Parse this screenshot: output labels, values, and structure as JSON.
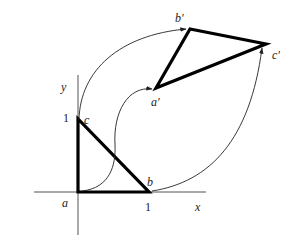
{
  "diagram": {
    "type": "linear-transformation-mapping",
    "axes": {
      "x_label": "x",
      "y_label": "y",
      "x_tick": "1",
      "y_tick": "1"
    },
    "source_triangle": {
      "vertices": [
        {
          "name": "a",
          "label": "a",
          "coords": [
            0,
            0
          ]
        },
        {
          "name": "b",
          "label": "b",
          "coords": [
            1,
            0
          ]
        },
        {
          "name": "c",
          "label": "c",
          "coords": [
            0,
            1
          ]
        }
      ]
    },
    "image_triangle": {
      "vertices": [
        {
          "name": "a'",
          "label": "a'"
        },
        {
          "name": "b'",
          "label": "b'"
        },
        {
          "name": "c'",
          "label": "c'"
        }
      ]
    },
    "mappings": [
      {
        "from": "a",
        "to": "a'"
      },
      {
        "from": "c",
        "to": "b'"
      },
      {
        "from": "b",
        "to": "c'"
      }
    ],
    "colors": {
      "stroke": "#000000",
      "axis": "#444444",
      "background": "#ffffff"
    }
  }
}
